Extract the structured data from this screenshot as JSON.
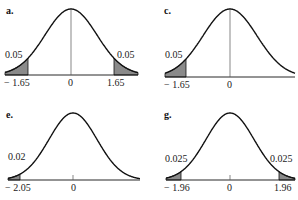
{
  "panels": [
    {
      "id": "a",
      "label": "a.",
      "tails": "two",
      "left_area": "0.05",
      "right_area": "0.05",
      "ticks": [
        "− 1.65",
        "0",
        "1.65"
      ],
      "critical_values": [
        -1.65,
        1.65
      ]
    },
    {
      "id": "c",
      "label": "c.",
      "tails": "left",
      "left_area": "0.05",
      "ticks": [
        "− 1.65",
        "0"
      ],
      "critical_values": [
        -1.65
      ]
    },
    {
      "id": "e",
      "label": "e.",
      "tails": "left",
      "left_area": "0.02",
      "ticks": [
        "− 2.05",
        "0"
      ],
      "critical_values": [
        -2.05
      ]
    },
    {
      "id": "g",
      "label": "g.",
      "tails": "two",
      "left_area": "0.025",
      "right_area": "0.025",
      "ticks": [
        "− 1.96",
        "0",
        "1.96"
      ],
      "critical_values": [
        -1.96,
        1.96
      ]
    }
  ],
  "colors": {
    "shade": "#8a8a8a",
    "curve": "#111111"
  }
}
